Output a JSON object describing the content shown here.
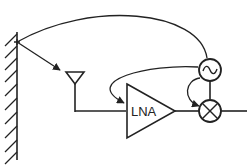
{
  "diagram": {
    "type": "rf-receiver-leakage",
    "blocks": {
      "lna": {
        "label": "LNA"
      },
      "oscillator": {
        "symbol": "~"
      },
      "mixer": {
        "symbol": "x"
      }
    },
    "colors": {
      "stroke": "#222222",
      "background": "#ffffff"
    }
  }
}
